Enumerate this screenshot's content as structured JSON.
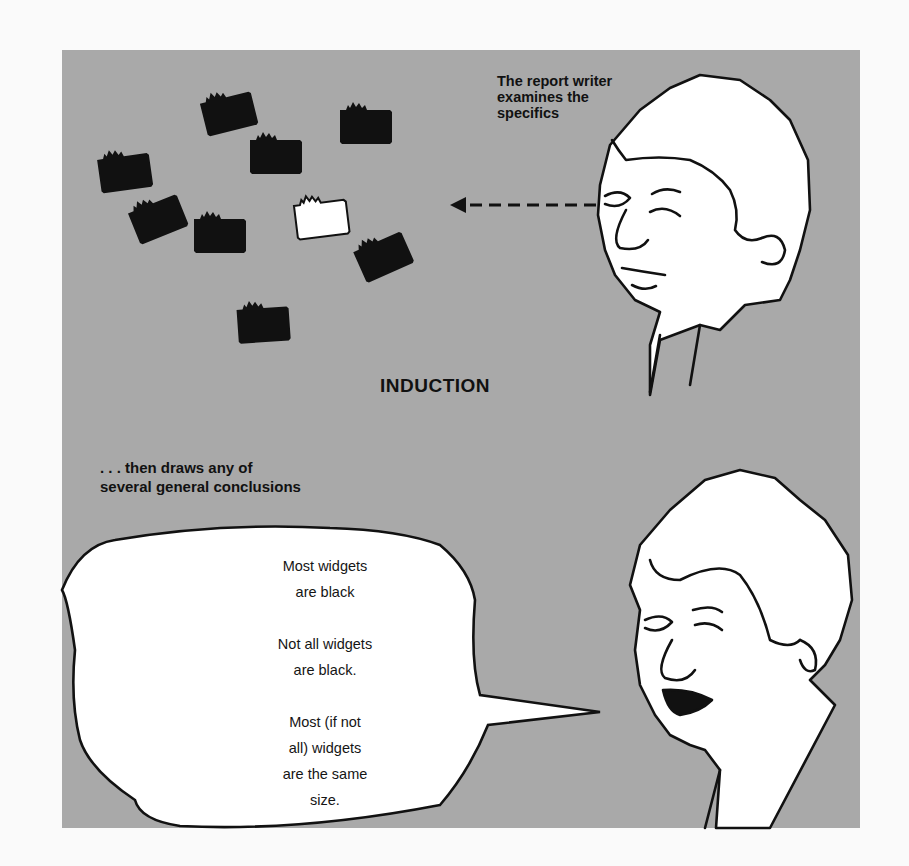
{
  "figure": {
    "title": "INDUCTION",
    "top_caption": [
      "The report writer",
      "examines the",
      "specifics"
    ],
    "middle_caption": [
      ". . . then draws any of",
      "several general conclusions"
    ],
    "speech_bubble": {
      "conclusions": [
        [
          "Most widgets",
          "are black"
        ],
        [
          "Not all widgets",
          "are black."
        ],
        [
          "Most (if not",
          "all) widgets",
          "are the same",
          "size."
        ]
      ]
    },
    "widgets": {
      "black_count": 9,
      "white_count": 1
    },
    "colors": {
      "panel_background": "#a9a9a9",
      "page_background": "#fafafa",
      "ink": "#111111",
      "bubble_fill": "#ffffff"
    }
  }
}
